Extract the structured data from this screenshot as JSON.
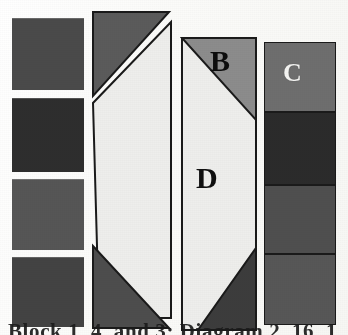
{
  "figure": {
    "kind": "scanned-geometric-figure",
    "background_color": "#fdfdfb",
    "width": 348,
    "height": 335
  },
  "labels": {
    "b": "B",
    "c": "C",
    "d": "D"
  },
  "caption": {
    "text": "Block 1, 4, and 3; Diagram 2, 16, 1",
    "note_visible": "bottom caption line is cropped; only the top edge of the letters is rendered"
  },
  "colors": {
    "dark_gray": "#4a4a4a",
    "darker_gray": "#343434",
    "darkest_gray": "#2b2b2b",
    "mid_gray": "#6e6e6e",
    "light_gray": "#8c8c8c",
    "near_white": "#eeeeec",
    "outline": "#1a1a1a",
    "paper": "#fdfdfb",
    "label_dark": "#0d0d0d",
    "label_light": "#f4f4f2"
  },
  "columns": [
    {
      "name": "column-1-stacked-squares",
      "x": 12,
      "width": 72,
      "blocks": [
        {
          "name": "block-1",
          "y": 18,
          "height": 72,
          "fill": "#4a4a4a"
        },
        {
          "name": "block-2",
          "y": 98,
          "height": 74,
          "fill": "#2e2e2e"
        },
        {
          "name": "block-3",
          "y": 179,
          "height": 71,
          "fill": "#565656"
        },
        {
          "name": "block-4",
          "y": 257,
          "height": 68,
          "fill": "#434343"
        }
      ]
    },
    {
      "name": "column-2-triangles-and-parallelogram",
      "x": 92,
      "width": 78,
      "parts": [
        {
          "name": "top-left-triangle",
          "fill": "#5b5b5b"
        },
        {
          "name": "center-parallelogram",
          "fill": "#eeeeec"
        },
        {
          "name": "bottom-right-triangle",
          "fill": "#4d4d4d"
        }
      ]
    },
    {
      "name": "column-3-labeled-panel",
      "x": 182,
      "width": 74,
      "parts": [
        {
          "name": "top-right-triangle-b",
          "fill": "#8c8c8c",
          "label": "B"
        },
        {
          "name": "center-region-d",
          "fill": "#eeeeec",
          "label": "D"
        },
        {
          "name": "bottom-right-triangle",
          "fill": "#3c3c3c"
        }
      ]
    },
    {
      "name": "column-4-stacked-blocks",
      "x": 264,
      "width": 72,
      "blocks": [
        {
          "name": "block-1",
          "y": 42,
          "height": 70,
          "fill": "#6e6e6e",
          "label": "C"
        },
        {
          "name": "block-2",
          "y": 113,
          "height": 72,
          "fill": "#2b2b2b"
        },
        {
          "name": "block-3",
          "y": 186,
          "height": 68,
          "fill": "#4f4f4f"
        },
        {
          "name": "block-4",
          "y": 255,
          "height": 70,
          "fill": "#575757"
        }
      ]
    }
  ]
}
